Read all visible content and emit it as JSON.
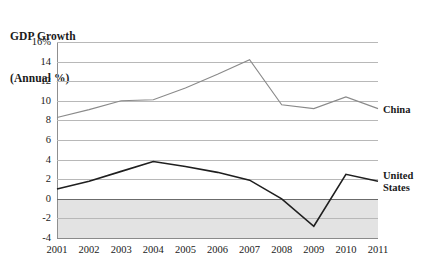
{
  "chart_data": {
    "type": "line",
    "title": "GDP Growth\n(Annual %)",
    "title_lines": [
      "GDP Growth",
      "(Annual %)"
    ],
    "xlabel": "",
    "ylabel": "",
    "x": [
      2001,
      2002,
      2003,
      2004,
      2005,
      2006,
      2007,
      2008,
      2009,
      2010,
      2011
    ],
    "categories": [
      "2001",
      "2002",
      "2003",
      "2004",
      "2005",
      "2006",
      "2007",
      "2008",
      "2009",
      "2010",
      "2011"
    ],
    "ylim": [
      -4,
      16
    ],
    "y_ticks": [
      16,
      14,
      12,
      10,
      8,
      6,
      4,
      2,
      0,
      -2,
      -4
    ],
    "y_tick_labels": [
      "16%",
      "14",
      "12",
      "10",
      "8",
      "6",
      "4",
      "2",
      "0",
      "-2",
      "-4"
    ],
    "grid": true,
    "legend_position": "right-inline",
    "series": [
      {
        "name": "China",
        "label_lines": [
          "China"
        ],
        "color": "#8a8a8a",
        "width": 1.1,
        "values": [
          8.3,
          9.1,
          10.0,
          10.1,
          11.3,
          12.7,
          14.2,
          9.6,
          9.2,
          10.4,
          9.2
        ]
      },
      {
        "name": "United States",
        "label_lines": [
          "United",
          "States"
        ],
        "color": "#1f1f1f",
        "width": 1.6,
        "values": [
          1.0,
          1.8,
          2.8,
          3.8,
          3.3,
          2.7,
          1.9,
          0.0,
          -2.8,
          2.5,
          1.8
        ]
      }
    ],
    "shaded_band": {
      "from": 0,
      "to": -4,
      "color": "#e3e3e3"
    },
    "colors": {
      "gridline": "#b8b8b8",
      "zero_line": "#6b6b6b",
      "axis": "#8f8f8f",
      "text": "#1a1a1a"
    }
  }
}
